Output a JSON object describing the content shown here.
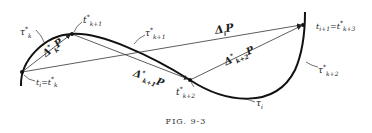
{
  "figure": {
    "caption": "FIG. 9-3",
    "points": [
      {
        "id": "P_ti",
        "label": "t_i = t*_k",
        "x": 22,
        "y": 72
      },
      {
        "id": "P_tk1",
        "label": "t*_{k+1}",
        "x": 72,
        "y": 34
      },
      {
        "id": "P_tk2",
        "label": "t*_{k+2}",
        "x": 190,
        "y": 80
      },
      {
        "id": "P_ti1",
        "label": "t_{i+1} = t*_{k+3}",
        "x": 303,
        "y": 25
      }
    ],
    "vectors": [
      {
        "label": "Δ*_k P",
        "from": "P_ti",
        "to": "P_tk1"
      },
      {
        "label": "Δ*_{k+1} P",
        "from": "P_tk1",
        "to": "P_tk2"
      },
      {
        "label": "Δ*_{k+2} P",
        "from": "P_tk2",
        "to": "P_ti1"
      },
      {
        "label": "Δ_i P",
        "from": "P_ti",
        "to": "P_ti1"
      }
    ],
    "arc_labels": [
      "τ*_k",
      "τ*_{k+1}",
      "τ*_{k+2}",
      "τ_i"
    ]
  },
  "labels": {
    "tau_k": {
      "sym": "τ",
      "sup": "*",
      "sub": "k"
    },
    "tk1": {
      "sym": "t",
      "sup": "*",
      "sub": "k+1"
    },
    "tau_k1": {
      "sym": "τ",
      "sup": "*",
      "sub": "k+1"
    },
    "delta_k": {
      "sym": "Δ",
      "sup": "*",
      "sub": "k",
      "tail": "P"
    },
    "ti": {
      "sym": "t",
      "sub": "i",
      "eq": "=t",
      "sup2": "*",
      "sub2": "k"
    },
    "delta_k1": {
      "sym": "Δ",
      "sup": "*",
      "sub": "k+1",
      "tail": "P"
    },
    "tk2": {
      "sym": "t",
      "sup": "*",
      "sub": "k+2"
    },
    "delta_i": {
      "sym": "Δ",
      "sub": "i",
      "tail": "P"
    },
    "delta_k2": {
      "sym": "Δ",
      "sup": "*",
      "sub": "k+2",
      "tail": "P"
    },
    "ti1": {
      "sym": "t",
      "sub": "i+1",
      "eq": "=t",
      "sup2": "*",
      "sub2": "k+3"
    },
    "tau_k2": {
      "sym": "τ",
      "sup": "*",
      "sub": "k+2"
    },
    "tau_i": {
      "sym": "τ",
      "sub": "i"
    }
  }
}
